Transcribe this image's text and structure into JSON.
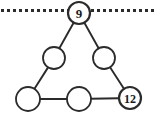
{
  "figure": {
    "name": "magic-triangle-puzzle",
    "canvas": {
      "width": 155,
      "height": 121
    },
    "background_color": "#ffffff",
    "stroke_color": "#2b2b2b",
    "label_color": "#1a1a1a"
  },
  "dotted_line": {
    "name": "top-dotted-line",
    "y": 10.5,
    "x_start": 1,
    "x_end": 154,
    "dot_size": 3,
    "gap": 3,
    "color": "#2b2b2b"
  },
  "nodes": [
    {
      "id": "apex",
      "label": "9",
      "filled": true,
      "cx": 79,
      "cy": 13,
      "r": 11,
      "stroke_width": 2.2,
      "font_size": 13
    },
    {
      "id": "left-upper",
      "label": "",
      "filled": false,
      "cx": 54,
      "cy": 58,
      "r": 11,
      "stroke_width": 1.8,
      "font_size": 13
    },
    {
      "id": "right-upper",
      "label": "",
      "filled": false,
      "cx": 104,
      "cy": 58,
      "r": 11,
      "stroke_width": 1.8,
      "font_size": 13
    },
    {
      "id": "bottom-left",
      "label": "",
      "filled": false,
      "cx": 28,
      "cy": 99,
      "r": 12,
      "stroke_width": 1.8,
      "font_size": 13
    },
    {
      "id": "bottom-middle",
      "label": "",
      "filled": false,
      "cx": 79,
      "cy": 99,
      "r": 12,
      "stroke_width": 1.8,
      "font_size": 13
    },
    {
      "id": "bottom-right",
      "label": "12",
      "filled": true,
      "cx": 130,
      "cy": 98,
      "r": 11,
      "stroke_width": 2.2,
      "font_size": 12
    }
  ],
  "edges": [
    {
      "id": "apex-to-left-upper",
      "from": "apex",
      "to": "left-upper"
    },
    {
      "id": "apex-to-right-upper",
      "from": "apex",
      "to": "right-upper"
    },
    {
      "id": "left-upper-to-bottom-left",
      "from": "left-upper",
      "to": "bottom-left"
    },
    {
      "id": "right-upper-to-bottom-right",
      "from": "right-upper",
      "to": "bottom-right"
    },
    {
      "id": "bottom-left-to-bottom-middle",
      "from": "bottom-left",
      "to": "bottom-middle"
    },
    {
      "id": "bottom-middle-to-bottom-right",
      "from": "bottom-middle",
      "to": "bottom-right"
    }
  ]
}
